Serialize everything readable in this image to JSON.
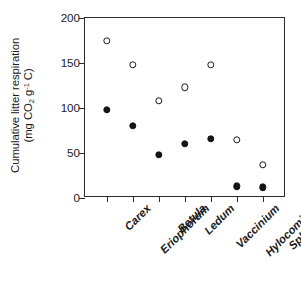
{
  "chart_data": {
    "type": "scatter",
    "title": "",
    "xlabel": "",
    "ylabel_line1": "Cumulative litter respiration",
    "ylabel_line2_pre": "(mg CO",
    "ylabel_line2_sub": "2",
    "ylabel_line2_mid": " g",
    "ylabel_line2_sup": "-1",
    "ylabel_line2_post": " C)",
    "ylabel_plain": "Cumulative litter respiration (mg CO2 g-1 C)",
    "categories": [
      "Carex",
      "Eriophorum",
      "Betula",
      "Ledum",
      "Vaccinium",
      "Hylocomium",
      "Sphagnum"
    ],
    "ylim": [
      0,
      200
    ],
    "yticks": [
      0,
      50,
      100,
      150,
      200
    ],
    "ytick_labels": [
      "0",
      "50",
      "100",
      "150",
      "200"
    ],
    "grid": false,
    "legend": "none",
    "series": [
      {
        "name": "open-circles",
        "marker": "open-circle",
        "color": "#1a1a1a",
        "values": [
          175,
          148,
          108,
          123,
          148,
          65,
          37
        ]
      },
      {
        "name": "filled-circles",
        "marker": "filled-circle",
        "color": "#141414",
        "values": [
          98,
          80,
          48,
          60,
          66,
          13,
          12
        ]
      }
    ]
  }
}
